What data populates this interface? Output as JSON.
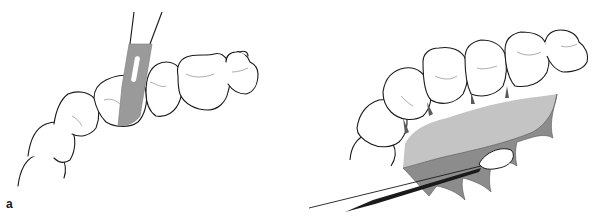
{
  "figure": {
    "panels": [
      {
        "id": "a",
        "label": "a",
        "description": "Scalpel blade placed in interdental area of lower tooth row"
      },
      {
        "id": "b",
        "label": "b",
        "description": "Gingival tissue reflected from tooth row with instrument tip"
      }
    ],
    "colors": {
      "outline": "#1a1a1a",
      "blade": "#9a9a9a",
      "tissue_light": "#c4c4c4",
      "tissue_dark": "#8c8c8c",
      "background": "#ffffff"
    }
  }
}
